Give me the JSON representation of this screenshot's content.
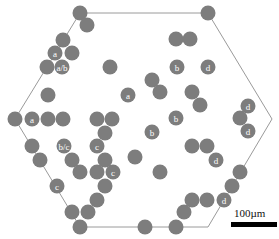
{
  "figure": {
    "shape": "hexagon",
    "outline_color": "#9a9a9a",
    "circle_color": "#7d7d7d",
    "label_color": "#ffffff",
    "hexagon_vertices": [
      [
        80,
        13
      ],
      [
        208,
        13
      ],
      [
        272,
        119
      ],
      [
        208,
        227
      ],
      [
        80,
        227
      ],
      [
        15,
        119
      ]
    ],
    "circles": [
      {
        "x": 80,
        "y": 13,
        "label": ""
      },
      {
        "x": 208,
        "y": 13,
        "label": ""
      },
      {
        "x": 87,
        "y": 25,
        "label": ""
      },
      {
        "x": 176,
        "y": 39,
        "label": ""
      },
      {
        "x": 190,
        "y": 39,
        "label": ""
      },
      {
        "x": 63,
        "y": 40,
        "label": ""
      },
      {
        "x": 55,
        "y": 53,
        "label": "a"
      },
      {
        "x": 72,
        "y": 53,
        "label": ""
      },
      {
        "x": 47,
        "y": 67,
        "label": ""
      },
      {
        "x": 62,
        "y": 67,
        "label": "a/b"
      },
      {
        "x": 110,
        "y": 67,
        "label": ""
      },
      {
        "x": 177,
        "y": 67,
        "label": "b"
      },
      {
        "x": 208,
        "y": 67,
        "label": "d"
      },
      {
        "x": 152,
        "y": 80,
        "label": ""
      },
      {
        "x": 160,
        "y": 92,
        "label": ""
      },
      {
        "x": 192,
        "y": 92,
        "label": ""
      },
      {
        "x": 48,
        "y": 95,
        "label": ""
      },
      {
        "x": 128,
        "y": 95,
        "label": "a"
      },
      {
        "x": 200,
        "y": 105,
        "label": ""
      },
      {
        "x": 248,
        "y": 106,
        "label": "d"
      },
      {
        "x": 15,
        "y": 119,
        "label": ""
      },
      {
        "x": 32,
        "y": 119,
        "label": "a"
      },
      {
        "x": 48,
        "y": 119,
        "label": ""
      },
      {
        "x": 63,
        "y": 119,
        "label": ""
      },
      {
        "x": 97,
        "y": 119,
        "label": ""
      },
      {
        "x": 112,
        "y": 119,
        "label": ""
      },
      {
        "x": 176,
        "y": 118,
        "label": "b"
      },
      {
        "x": 240,
        "y": 118,
        "label": ""
      },
      {
        "x": 105,
        "y": 133,
        "label": ""
      },
      {
        "x": 152,
        "y": 132,
        "label": "b"
      },
      {
        "x": 248,
        "y": 131,
        "label": "d"
      },
      {
        "x": 32,
        "y": 146,
        "label": ""
      },
      {
        "x": 64,
        "y": 146,
        "label": "b/c"
      },
      {
        "x": 97,
        "y": 146,
        "label": "c"
      },
      {
        "x": 192,
        "y": 146,
        "label": ""
      },
      {
        "x": 207,
        "y": 146,
        "label": ""
      },
      {
        "x": 40,
        "y": 160,
        "label": ""
      },
      {
        "x": 72,
        "y": 160,
        "label": ""
      },
      {
        "x": 105,
        "y": 160,
        "label": ""
      },
      {
        "x": 135,
        "y": 157,
        "label": ""
      },
      {
        "x": 216,
        "y": 160,
        "label": "d"
      },
      {
        "x": 80,
        "y": 172,
        "label": ""
      },
      {
        "x": 97,
        "y": 172,
        "label": ""
      },
      {
        "x": 113,
        "y": 172,
        "label": "c"
      },
      {
        "x": 160,
        "y": 172,
        "label": ""
      },
      {
        "x": 240,
        "y": 172,
        "label": ""
      },
      {
        "x": 57,
        "y": 186,
        "label": "c"
      },
      {
        "x": 105,
        "y": 186,
        "label": ""
      },
      {
        "x": 232,
        "y": 186,
        "label": ""
      },
      {
        "x": 97,
        "y": 200,
        "label": ""
      },
      {
        "x": 192,
        "y": 200,
        "label": ""
      },
      {
        "x": 207,
        "y": 200,
        "label": ""
      },
      {
        "x": 224,
        "y": 200,
        "label": "d"
      },
      {
        "x": 72,
        "y": 212,
        "label": ""
      },
      {
        "x": 88,
        "y": 212,
        "label": ""
      },
      {
        "x": 184,
        "y": 212,
        "label": ""
      },
      {
        "x": 80,
        "y": 227,
        "label": ""
      },
      {
        "x": 145,
        "y": 227,
        "label": ""
      },
      {
        "x": 176,
        "y": 227,
        "label": ""
      }
    ],
    "circle_radius": 7.5
  },
  "scale_bar": {
    "label": "100µm",
    "color": "#000000"
  }
}
